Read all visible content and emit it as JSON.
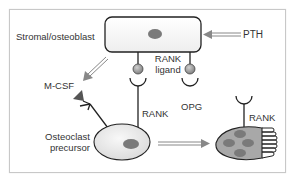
{
  "diagram": {
    "labels": {
      "stromal": "Stromal/osteoblast",
      "pth": "PTH",
      "mcsf": "M-CSF",
      "rank_ligand_line1": "RANK",
      "rank_ligand_line2": "ligand",
      "opg": "OPG",
      "rank_precursor": "RANK",
      "rank_osteoclast": "RANK",
      "precursor_line1": "Osteoclast",
      "precursor_line2": "precursor"
    },
    "colors": {
      "frame_border": "#c8c8c8",
      "outline": "#222222",
      "nucleus": "#7a7a7a",
      "ligand_ball": "#9a9a9a",
      "arrow": "#888888",
      "osteoclast_fill": "#a8a8a8",
      "precursor_fill": "#ededed"
    },
    "nodes": [
      {
        "id": "stromal-cell",
        "type": "rounded-rect"
      },
      {
        "id": "osteoclast-precursor",
        "type": "ellipse"
      },
      {
        "id": "osteoclast",
        "type": "multinucleated-cell",
        "nuclei": 4
      }
    ],
    "edges": [
      {
        "from": "PTH",
        "to": "stromal-cell",
        "style": "double-arrow"
      },
      {
        "from": "stromal-cell",
        "to": "M-CSF",
        "style": "double-arrow"
      },
      {
        "from": "osteoclast-precursor",
        "to": "osteoclast",
        "style": "double-arrow"
      }
    ]
  }
}
